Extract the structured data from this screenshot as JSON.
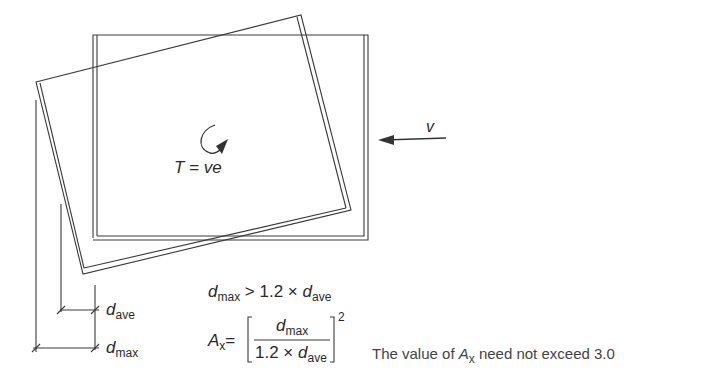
{
  "diagram": {
    "labels": {
      "torque": "T = ve",
      "shear": "v",
      "d_ave_symbol": "d",
      "d_ave_sub": "ave",
      "d_max_symbol": "d",
      "d_max_sub": "max"
    },
    "equations": {
      "condition": {
        "lhs_symbol": "d",
        "lhs_sub": "max",
        "operator": " > 1.2 × ",
        "rhs_symbol": "d",
        "rhs_sub": "ave"
      },
      "amplification": {
        "lhs_symbol": "A",
        "lhs_sub": "x",
        "equals": "=",
        "numerator_symbol": "d",
        "numerator_sub": "max",
        "denominator_prefix": "1.2 × ",
        "denominator_symbol": "d",
        "denominator_sub": "ave",
        "exponent": "2"
      }
    },
    "note": {
      "prefix": "The value of ",
      "symbol": "A",
      "sub": "x",
      "suffix": " need not exceed 3.0"
    },
    "colors": {
      "line": "#333333",
      "text": "#2a2a2a"
    }
  }
}
